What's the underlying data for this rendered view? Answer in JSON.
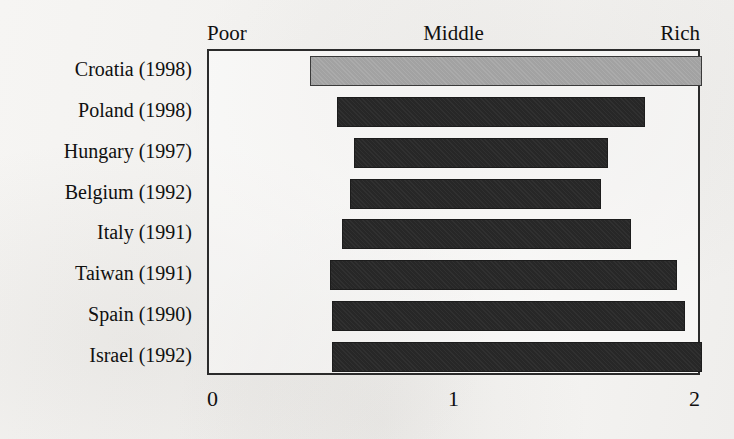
{
  "chart_data": {
    "type": "bar",
    "orientation": "horizontal",
    "title": "",
    "subtitle": "",
    "xlabel": "",
    "ylabel": "",
    "xlim": [
      0,
      2
    ],
    "xticks": [
      "0",
      "1",
      "2"
    ],
    "xtick_values": [
      0,
      1,
      2
    ],
    "grid": false,
    "legend": "none",
    "band_labels": [
      "Poor",
      "Middle",
      "Rich"
    ],
    "categories": [
      "Croatia (1998)",
      "Poland (1998)",
      "Hungary (1997)",
      "Belgium (1992)",
      "Italy (1991)",
      "Taiwan (1991)",
      "Spain (1990)",
      "Israel (1992)"
    ],
    "note": "Each row is a floating range bar spanning from a low value to a high value on a 0-2 Poor-to-Rich scale. The top row (Croatia) is drawn in light grey; all other rows are dark.",
    "bars": [
      {
        "category": "Croatia (1998)",
        "start": 0.41,
        "end": 2.0,
        "length": 1.59,
        "color": "#a2a2a2",
        "highlight": true
      },
      {
        "category": "Poland (1998)",
        "start": 0.52,
        "end": 1.77,
        "length": 1.25,
        "color": "#272727",
        "highlight": false
      },
      {
        "category": "Hungary (1997)",
        "start": 0.59,
        "end": 1.62,
        "length": 1.03,
        "color": "#272727",
        "highlight": false
      },
      {
        "category": "Belgium (1992)",
        "start": 0.57,
        "end": 1.59,
        "length": 1.02,
        "color": "#272727",
        "highlight": false
      },
      {
        "category": "Italy (1991)",
        "start": 0.54,
        "end": 1.71,
        "length": 1.17,
        "color": "#272727",
        "highlight": false
      },
      {
        "category": "Taiwan (1991)",
        "start": 0.49,
        "end": 1.9,
        "length": 1.41,
        "color": "#272727",
        "highlight": false
      },
      {
        "category": "Spain (1990)",
        "start": 0.5,
        "end": 1.93,
        "length": 1.43,
        "color": "#272727",
        "highlight": false
      },
      {
        "category": "Israel (1992)",
        "start": 0.5,
        "end": 2.0,
        "length": 1.5,
        "color": "#272727",
        "highlight": false
      }
    ]
  },
  "colors": {
    "highlight_bar": "#a2a2a2",
    "bar": "#272727",
    "frame": "#2b2b2b",
    "background": "#f4f3f1",
    "text": "#101010"
  }
}
